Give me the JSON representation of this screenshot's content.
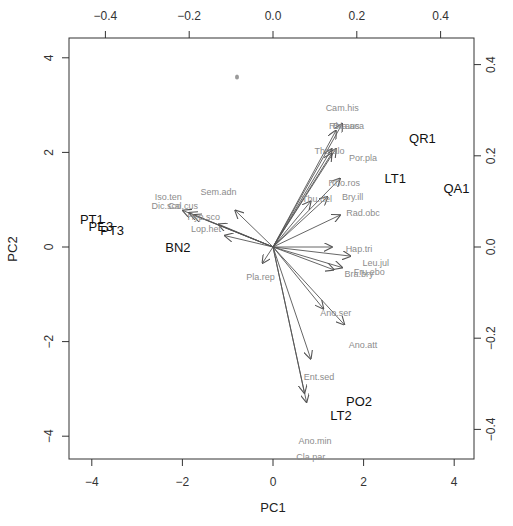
{
  "chart_data": {
    "type": "scatter",
    "subtype": "pca-biplot",
    "title": "",
    "xlabel": "PC1",
    "ylabel": "PC2",
    "xlim": [
      -4.5,
      4.5
    ],
    "ylim": [
      -4.5,
      4.4
    ],
    "x_ticks": [
      -4,
      -2,
      0,
      2,
      4
    ],
    "y_ticks": [
      -4,
      -2,
      0,
      2,
      4
    ],
    "top_axis_ticks": [
      -0.4,
      -0.2,
      0.0,
      0.2,
      0.4
    ],
    "right_axis_ticks": [
      -0.4,
      -0.2,
      0.0,
      0.2,
      0.4
    ],
    "top_axis_tick_labels": [
      "−0.4",
      "−0.2",
      "0.0",
      "0.2",
      "0.4"
    ],
    "right_axis_tick_labels": [
      "−0.4",
      "−0.2",
      "0.0",
      "0.2",
      "0.4"
    ],
    "x_tick_labels": [
      "−4",
      "−2",
      "0",
      "2",
      "4"
    ],
    "y_tick_labels": [
      "−4",
      "−2",
      "0",
      "2",
      "4"
    ],
    "grid": false,
    "legend": "none",
    "colors": {
      "sites": "#111111",
      "loadings_arrow": "#555555",
      "loadings_text": "#8c8c8c",
      "frame": "#333333"
    },
    "sites": [
      {
        "label": "QR1",
        "x": 3.3,
        "y": 2.3
      },
      {
        "label": "LT1",
        "x": 2.7,
        "y": 1.45
      },
      {
        "label": "QA1",
        "x": 4.05,
        "y": 1.25
      },
      {
        "label": "PT1",
        "x": -4.0,
        "y": 0.6
      },
      {
        "label": "PE3",
        "x": -3.8,
        "y": 0.45
      },
      {
        "label": "PT3",
        "x": -3.55,
        "y": 0.35
      },
      {
        "label": "BN2",
        "x": -2.1,
        "y": 0.0
      },
      {
        "label": "PO2",
        "x": 1.9,
        "y": -3.25
      },
      {
        "label": "LT2",
        "x": 1.5,
        "y": -3.55
      }
    ],
    "loadings": [
      {
        "label": "Cam.his",
        "x": 0.165,
        "y": 0.305,
        "tip_x": 0.165,
        "tip_y": 0.27
      },
      {
        "label": "Rhi.aus",
        "x": 0.17,
        "y": 0.265,
        "tip_x": 0.15,
        "tip_y": 0.255
      },
      {
        "label": "Bra.aca",
        "x": 0.18,
        "y": 0.265,
        "tip_x": 0.14,
        "tip_y": 0.215
      },
      {
        "label": "The.alo",
        "x": 0.135,
        "y": 0.21,
        "tip_x": 0.15,
        "tip_y": 0.215
      },
      {
        "label": "Por.pla",
        "x": 0.215,
        "y": 0.195,
        "tip_x": 0.14,
        "tip_y": 0.205
      },
      {
        "label": "Rho.ros",
        "x": 0.17,
        "y": 0.14,
        "tip_x": 0.16,
        "tip_y": 0.15
      },
      {
        "label": "Bry.ill",
        "x": 0.19,
        "y": 0.11,
        "tip_x": 0.13,
        "tip_y": 0.11
      },
      {
        "label": "Thu.del",
        "x": 0.105,
        "y": 0.105,
        "tip_x": 0.09,
        "tip_y": 0.1
      },
      {
        "label": "Rad.obc",
        "x": 0.215,
        "y": 0.075,
        "tip_x": 0.16,
        "tip_y": 0.07
      },
      {
        "label": "Hap.tri",
        "x": 0.205,
        "y": -0.005,
        "tip_x": 0.14,
        "tip_y": 0.0
      },
      {
        "label": "Leu.jul",
        "x": 0.245,
        "y": -0.035,
        "tip_x": 0.185,
        "tip_y": -0.02
      },
      {
        "label": "Fru.ebo",
        "x": 0.23,
        "y": -0.055,
        "tip_x": 0.165,
        "tip_y": -0.045
      },
      {
        "label": "Bra.bry",
        "x": 0.205,
        "y": -0.06,
        "tip_x": 0.145,
        "tip_y": -0.05
      },
      {
        "label": "Ano.ser",
        "x": 0.15,
        "y": -0.145,
        "tip_x": 0.12,
        "tip_y": -0.135
      },
      {
        "label": "Ano.att",
        "x": 0.215,
        "y": -0.215,
        "tip_x": 0.17,
        "tip_y": -0.17
      },
      {
        "label": "Ent.sed",
        "x": 0.11,
        "y": -0.285,
        "tip_x": 0.09,
        "tip_y": -0.245
      },
      {
        "label": "Ano.min",
        "x": 0.1,
        "y": -0.425,
        "tip_x": 0.08,
        "tip_y": -0.34
      },
      {
        "label": "Cla.par",
        "x": 0.09,
        "y": -0.46,
        "tip_x": 0.075,
        "tip_y": -0.32
      },
      {
        "label": "Pla.rep",
        "x": -0.03,
        "y": -0.065,
        "tip_x": -0.025,
        "tip_y": -0.035
      },
      {
        "label": "Sem.adn",
        "x": -0.13,
        "y": 0.12,
        "tip_x": -0.09,
        "tip_y": 0.08
      },
      {
        "label": "Iso.ten",
        "x": -0.25,
        "y": 0.11,
        "tip_x": -0.215,
        "tip_y": 0.08
      },
      {
        "label": "Dic.sco",
        "x": -0.255,
        "y": 0.09,
        "tip_x": -0.2,
        "tip_y": 0.075
      },
      {
        "label": "Cal.cus",
        "x": -0.215,
        "y": 0.09,
        "tip_x": -0.19,
        "tip_y": 0.07
      },
      {
        "label": "Hyp.sco",
        "x": -0.165,
        "y": 0.065,
        "tip_x": -0.13,
        "tip_y": 0.05
      },
      {
        "label": "Lop.het",
        "x": -0.16,
        "y": 0.04,
        "tip_x": -0.115,
        "tip_y": 0.025
      }
    ]
  }
}
